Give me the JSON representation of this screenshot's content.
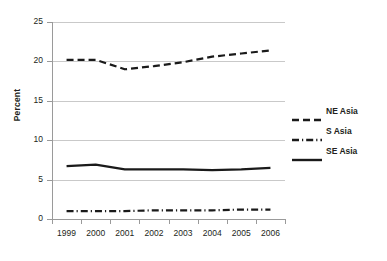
{
  "chart_data": {
    "type": "line",
    "title": "",
    "xlabel": "",
    "ylabel": "Percent",
    "categories": [
      "1999",
      "2000",
      "2001",
      "2002",
      "2003",
      "2004",
      "2005",
      "2006"
    ],
    "ylim": [
      0,
      25
    ],
    "yticks": [
      0,
      5,
      10,
      15,
      20,
      25
    ],
    "ytick_labels": [
      "0",
      "5",
      "10",
      "15",
      "20",
      "25"
    ],
    "grid": true,
    "legend_position": "right",
    "series": [
      {
        "name": "NE Asia",
        "style": "dashed",
        "color": "#1a1a1a",
        "values": [
          20.2,
          20.2,
          19.0,
          19.4,
          19.9,
          20.6,
          21.0,
          21.4
        ]
      },
      {
        "name": "S Asia",
        "style": "dash-dot",
        "color": "#1a1a1a",
        "values": [
          1.0,
          1.0,
          1.0,
          1.1,
          1.1,
          1.1,
          1.2,
          1.2
        ]
      },
      {
        "name": "SE Asia",
        "style": "solid",
        "color": "#1a1a1a",
        "values": [
          6.7,
          6.9,
          6.3,
          6.3,
          6.3,
          6.2,
          6.3,
          6.5
        ]
      }
    ]
  },
  "axis": {
    "y_title": "Percent"
  },
  "legend": {
    "items": [
      {
        "label": "NE Asia"
      },
      {
        "label": "S Asia"
      },
      {
        "label": "SE Asia"
      }
    ]
  }
}
